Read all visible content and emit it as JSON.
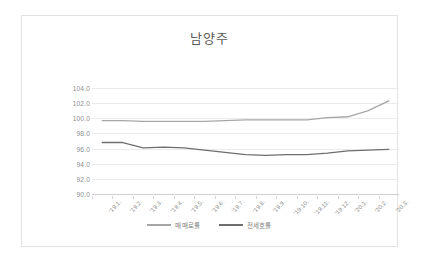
{
  "chart_data": {
    "type": "line",
    "title": "남양주",
    "xlabel": "",
    "ylabel": "",
    "ylim": [
      90.0,
      104.0
    ],
    "ystep": 2.0,
    "grid": true,
    "legend_position": "bottom",
    "categories": [
      "'19.1.",
      "'19.2.",
      "'19.3.",
      "'19.4.",
      "'19.5.",
      "'19.6.",
      "'19.7.",
      "'19.8.",
      "'19.9.",
      "'19.10.",
      "'19.11.",
      "'19.12.",
      "'20.1.",
      "'20.2.",
      "'20.3."
    ],
    "ytick_labels": [
      "104.0",
      "102.0",
      "100.0",
      "98.0",
      "96.0",
      "94.0",
      "92.0",
      "90.0"
    ],
    "ytick_values": [
      104.0,
      102.0,
      100.0,
      98.0,
      96.0,
      94.0,
      92.0,
      90.0
    ],
    "series": [
      {
        "name": "매매로률",
        "color": "#a6a6a6",
        "values": [
          99.7,
          99.7,
          99.6,
          99.6,
          99.6,
          99.6,
          99.7,
          99.8,
          99.8,
          99.8,
          99.8,
          100.1,
          100.2,
          101.0,
          102.3
        ]
      },
      {
        "name": "전세호률",
        "color": "#6e6e6e",
        "values": [
          96.8,
          96.8,
          96.1,
          96.2,
          96.1,
          95.8,
          95.5,
          95.2,
          95.1,
          95.2,
          95.2,
          95.4,
          95.7,
          95.8,
          95.9
        ]
      }
    ]
  },
  "legend": {
    "items": [
      {
        "label": "매매로률",
        "color": "#a6a6a6"
      },
      {
        "label": "전세호률",
        "color": "#6e6e6e"
      }
    ]
  }
}
